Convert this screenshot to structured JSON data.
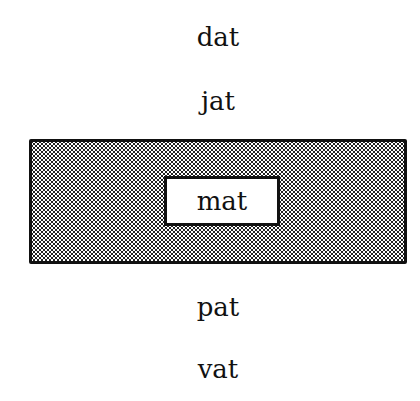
{
  "diagram": {
    "above": [
      "dat",
      "jat"
    ],
    "selected_box": {
      "label": "mat",
      "pattern": "dotted-gray",
      "border_color": "#111111"
    },
    "below": [
      "pat",
      "vat"
    ]
  }
}
